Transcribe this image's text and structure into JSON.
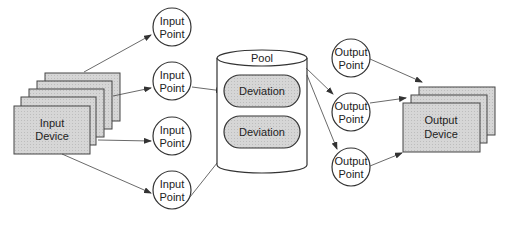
{
  "diagram": {
    "input_device": {
      "line1": "Input",
      "line2": "Device",
      "stack_count": 5
    },
    "input_points": [
      {
        "line1": "Input",
        "line2": "Point"
      },
      {
        "line1": "Input",
        "line2": "Point"
      },
      {
        "line1": "Input",
        "line2": "Point"
      },
      {
        "line1": "Input",
        "line2": "Point"
      }
    ],
    "pool": {
      "label": "Pool",
      "deviations": [
        {
          "label": "Deviation"
        },
        {
          "label": "Deviation"
        }
      ]
    },
    "output_points": [
      {
        "line1": "Output",
        "line2": "Point"
      },
      {
        "line1": "Output",
        "line2": "Point"
      },
      {
        "line1": "Output",
        "line2": "Point"
      }
    ],
    "output_device": {
      "line1": "Output",
      "line2": "Device",
      "stack_count": 3
    },
    "colors": {
      "box_fill": "#d4d4d4",
      "stroke": "#333333",
      "background": "#ffffff"
    }
  }
}
